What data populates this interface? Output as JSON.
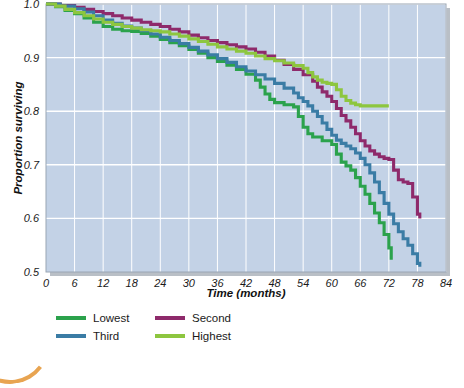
{
  "chart_data": {
    "type": "line",
    "title": "",
    "xlabel": "Time (months)",
    "ylabel": "Proportion surviving",
    "xlim": [
      0,
      84
    ],
    "ylim": [
      0.5,
      1.0
    ],
    "xticks": [
      0,
      6,
      12,
      18,
      24,
      30,
      36,
      42,
      48,
      54,
      60,
      66,
      72,
      78,
      84
    ],
    "yticks": [
      0.5,
      0.6,
      0.7,
      0.8,
      0.9,
      1.0
    ],
    "xtick_labels": [
      "0",
      "6",
      "12",
      "18",
      "24",
      "30",
      "36",
      "42",
      "48",
      "54",
      "60",
      "66",
      "72",
      "78",
      "84"
    ],
    "ytick_labels": [
      "0.5",
      "0.6",
      "0.7",
      "0.8",
      "0.9",
      "1.0"
    ],
    "grid": true,
    "step_style": "post",
    "legend_position": "below-left",
    "plot_background": "#C3D2E6",
    "gridline_color": "#FFFFFF",
    "series": [
      {
        "name": "Lowest",
        "color": "#2BA24C",
        "points": [
          [
            0,
            1.0
          ],
          [
            2,
            0.995
          ],
          [
            4,
            0.988
          ],
          [
            6,
            0.982
          ],
          [
            8,
            0.974
          ],
          [
            10,
            0.966
          ],
          [
            12,
            0.958
          ],
          [
            14,
            0.953
          ],
          [
            16,
            0.95
          ],
          [
            18,
            0.949
          ],
          [
            20,
            0.945
          ],
          [
            22,
            0.94
          ],
          [
            24,
            0.934
          ],
          [
            26,
            0.928
          ],
          [
            28,
            0.922
          ],
          [
            30,
            0.915
          ],
          [
            32,
            0.908
          ],
          [
            34,
            0.9
          ],
          [
            36,
            0.893
          ],
          [
            38,
            0.886
          ],
          [
            40,
            0.878
          ],
          [
            42,
            0.869
          ],
          [
            44,
            0.858
          ],
          [
            45,
            0.845
          ],
          [
            46,
            0.832
          ],
          [
            47,
            0.822
          ],
          [
            48,
            0.816
          ],
          [
            50,
            0.812
          ],
          [
            52,
            0.808
          ],
          [
            53,
            0.79
          ],
          [
            54,
            0.77
          ],
          [
            55,
            0.758
          ],
          [
            56,
            0.752
          ],
          [
            58,
            0.745
          ],
          [
            60,
            0.738
          ],
          [
            61,
            0.72
          ],
          [
            62,
            0.705
          ],
          [
            63,
            0.698
          ],
          [
            64,
            0.69
          ],
          [
            65,
            0.676
          ],
          [
            66,
            0.66
          ],
          [
            67,
            0.645
          ],
          [
            68,
            0.628
          ],
          [
            69,
            0.61
          ],
          [
            70,
            0.592
          ],
          [
            71,
            0.57
          ],
          [
            72,
            0.545
          ],
          [
            72.5,
            0.523
          ]
        ]
      },
      {
        "name": "Second",
        "color": "#8E2A6B",
        "points": [
          [
            0,
            1.0
          ],
          [
            3,
            0.997
          ],
          [
            6,
            0.994
          ],
          [
            8,
            0.99
          ],
          [
            10,
            0.986
          ],
          [
            12,
            0.982
          ],
          [
            14,
            0.978
          ],
          [
            16,
            0.974
          ],
          [
            18,
            0.97
          ],
          [
            20,
            0.966
          ],
          [
            22,
            0.962
          ],
          [
            24,
            0.958
          ],
          [
            26,
            0.953
          ],
          [
            28,
            0.948
          ],
          [
            30,
            0.942
          ],
          [
            32,
            0.937
          ],
          [
            34,
            0.932
          ],
          [
            36,
            0.928
          ],
          [
            38,
            0.924
          ],
          [
            40,
            0.92
          ],
          [
            42,
            0.916
          ],
          [
            44,
            0.91
          ],
          [
            46,
            0.903
          ],
          [
            48,
            0.895
          ],
          [
            50,
            0.887
          ],
          [
            52,
            0.878
          ],
          [
            54,
            0.868
          ],
          [
            56,
            0.856
          ],
          [
            57,
            0.845
          ],
          [
            58,
            0.836
          ],
          [
            59,
            0.828
          ],
          [
            60,
            0.818
          ],
          [
            61,
            0.805
          ],
          [
            62,
            0.792
          ],
          [
            63,
            0.782
          ],
          [
            64,
            0.77
          ],
          [
            65,
            0.758
          ],
          [
            66,
            0.745
          ],
          [
            67,
            0.735
          ],
          [
            68,
            0.726
          ],
          [
            69,
            0.72
          ],
          [
            70,
            0.715
          ],
          [
            71,
            0.712
          ],
          [
            72,
            0.71
          ],
          [
            73,
            0.69
          ],
          [
            74,
            0.672
          ],
          [
            75,
            0.668
          ],
          [
            76,
            0.665
          ],
          [
            77,
            0.64
          ],
          [
            78,
            0.608
          ],
          [
            78.5,
            0.6
          ]
        ]
      },
      {
        "name": "Third",
        "color": "#3A7CA5",
        "points": [
          [
            0,
            1.0
          ],
          [
            3,
            0.996
          ],
          [
            6,
            0.991
          ],
          [
            8,
            0.985
          ],
          [
            10,
            0.978
          ],
          [
            12,
            0.97
          ],
          [
            14,
            0.964
          ],
          [
            16,
            0.959
          ],
          [
            18,
            0.955
          ],
          [
            20,
            0.95
          ],
          [
            22,
            0.944
          ],
          [
            24,
            0.938
          ],
          [
            26,
            0.932
          ],
          [
            28,
            0.926
          ],
          [
            30,
            0.919
          ],
          [
            32,
            0.912
          ],
          [
            34,
            0.905
          ],
          [
            36,
            0.898
          ],
          [
            38,
            0.891
          ],
          [
            40,
            0.883
          ],
          [
            42,
            0.875
          ],
          [
            44,
            0.868
          ],
          [
            46,
            0.86
          ],
          [
            48,
            0.852
          ],
          [
            50,
            0.843
          ],
          [
            52,
            0.834
          ],
          [
            53,
            0.825
          ],
          [
            54,
            0.818
          ],
          [
            55,
            0.81
          ],
          [
            56,
            0.8
          ],
          [
            57,
            0.79
          ],
          [
            58,
            0.778
          ],
          [
            59,
            0.766
          ],
          [
            60,
            0.755
          ],
          [
            61,
            0.746
          ],
          [
            62,
            0.74
          ],
          [
            63,
            0.735
          ],
          [
            64,
            0.73
          ],
          [
            65,
            0.722
          ],
          [
            66,
            0.712
          ],
          [
            67,
            0.7
          ],
          [
            68,
            0.685
          ],
          [
            69,
            0.668
          ],
          [
            70,
            0.648
          ],
          [
            71,
            0.628
          ],
          [
            72,
            0.608
          ],
          [
            73,
            0.59
          ],
          [
            74,
            0.575
          ],
          [
            75,
            0.562
          ],
          [
            76,
            0.55
          ],
          [
            77,
            0.534
          ],
          [
            78,
            0.516
          ],
          [
            78.5,
            0.51
          ]
        ]
      },
      {
        "name": "Highest",
        "color": "#8DC63F",
        "points": [
          [
            0,
            1.0
          ],
          [
            2,
            0.996
          ],
          [
            4,
            0.99
          ],
          [
            6,
            0.984
          ],
          [
            8,
            0.978
          ],
          [
            10,
            0.972
          ],
          [
            12,
            0.966
          ],
          [
            14,
            0.962
          ],
          [
            16,
            0.958
          ],
          [
            18,
            0.955
          ],
          [
            20,
            0.952
          ],
          [
            22,
            0.95
          ],
          [
            24,
            0.948
          ],
          [
            26,
            0.944
          ],
          [
            28,
            0.94
          ],
          [
            30,
            0.935
          ],
          [
            32,
            0.93
          ],
          [
            34,
            0.925
          ],
          [
            36,
            0.92
          ],
          [
            38,
            0.916
          ],
          [
            40,
            0.912
          ],
          [
            42,
            0.908
          ],
          [
            44,
            0.903
          ],
          [
            46,
            0.898
          ],
          [
            48,
            0.894
          ],
          [
            50,
            0.89
          ],
          [
            52,
            0.885
          ],
          [
            54,
            0.88
          ],
          [
            55,
            0.872
          ],
          [
            56,
            0.864
          ],
          [
            57,
            0.858
          ],
          [
            58,
            0.854
          ],
          [
            59,
            0.852
          ],
          [
            60,
            0.85
          ],
          [
            61,
            0.84
          ],
          [
            62,
            0.828
          ],
          [
            63,
            0.82
          ],
          [
            64,
            0.815
          ],
          [
            65,
            0.812
          ],
          [
            66,
            0.81
          ],
          [
            68,
            0.81
          ],
          [
            70,
            0.81
          ],
          [
            72,
            0.81
          ]
        ]
      }
    ]
  },
  "legend": {
    "entries": [
      {
        "label": "Lowest",
        "color": "#2BA24C"
      },
      {
        "label": "Second",
        "color": "#8E2A6B"
      },
      {
        "label": "Third",
        "color": "#3A7CA5"
      },
      {
        "label": "Highest",
        "color": "#8DC63F"
      }
    ]
  },
  "decoration": {
    "corner_arc_color": "#E8A451"
  }
}
